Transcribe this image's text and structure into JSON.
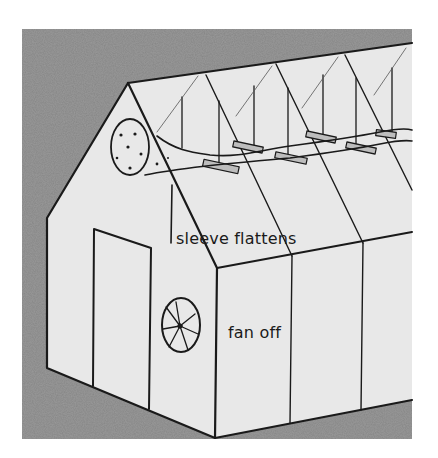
{
  "figure": {
    "labels": {
      "sleeve": "sleeve flattens",
      "fan": "fan off"
    },
    "colors": {
      "background_texture": "#8f8f8f",
      "structure_fill": "#e6e6e6",
      "line": "#1a1a1a",
      "page": "#ffffff"
    }
  }
}
